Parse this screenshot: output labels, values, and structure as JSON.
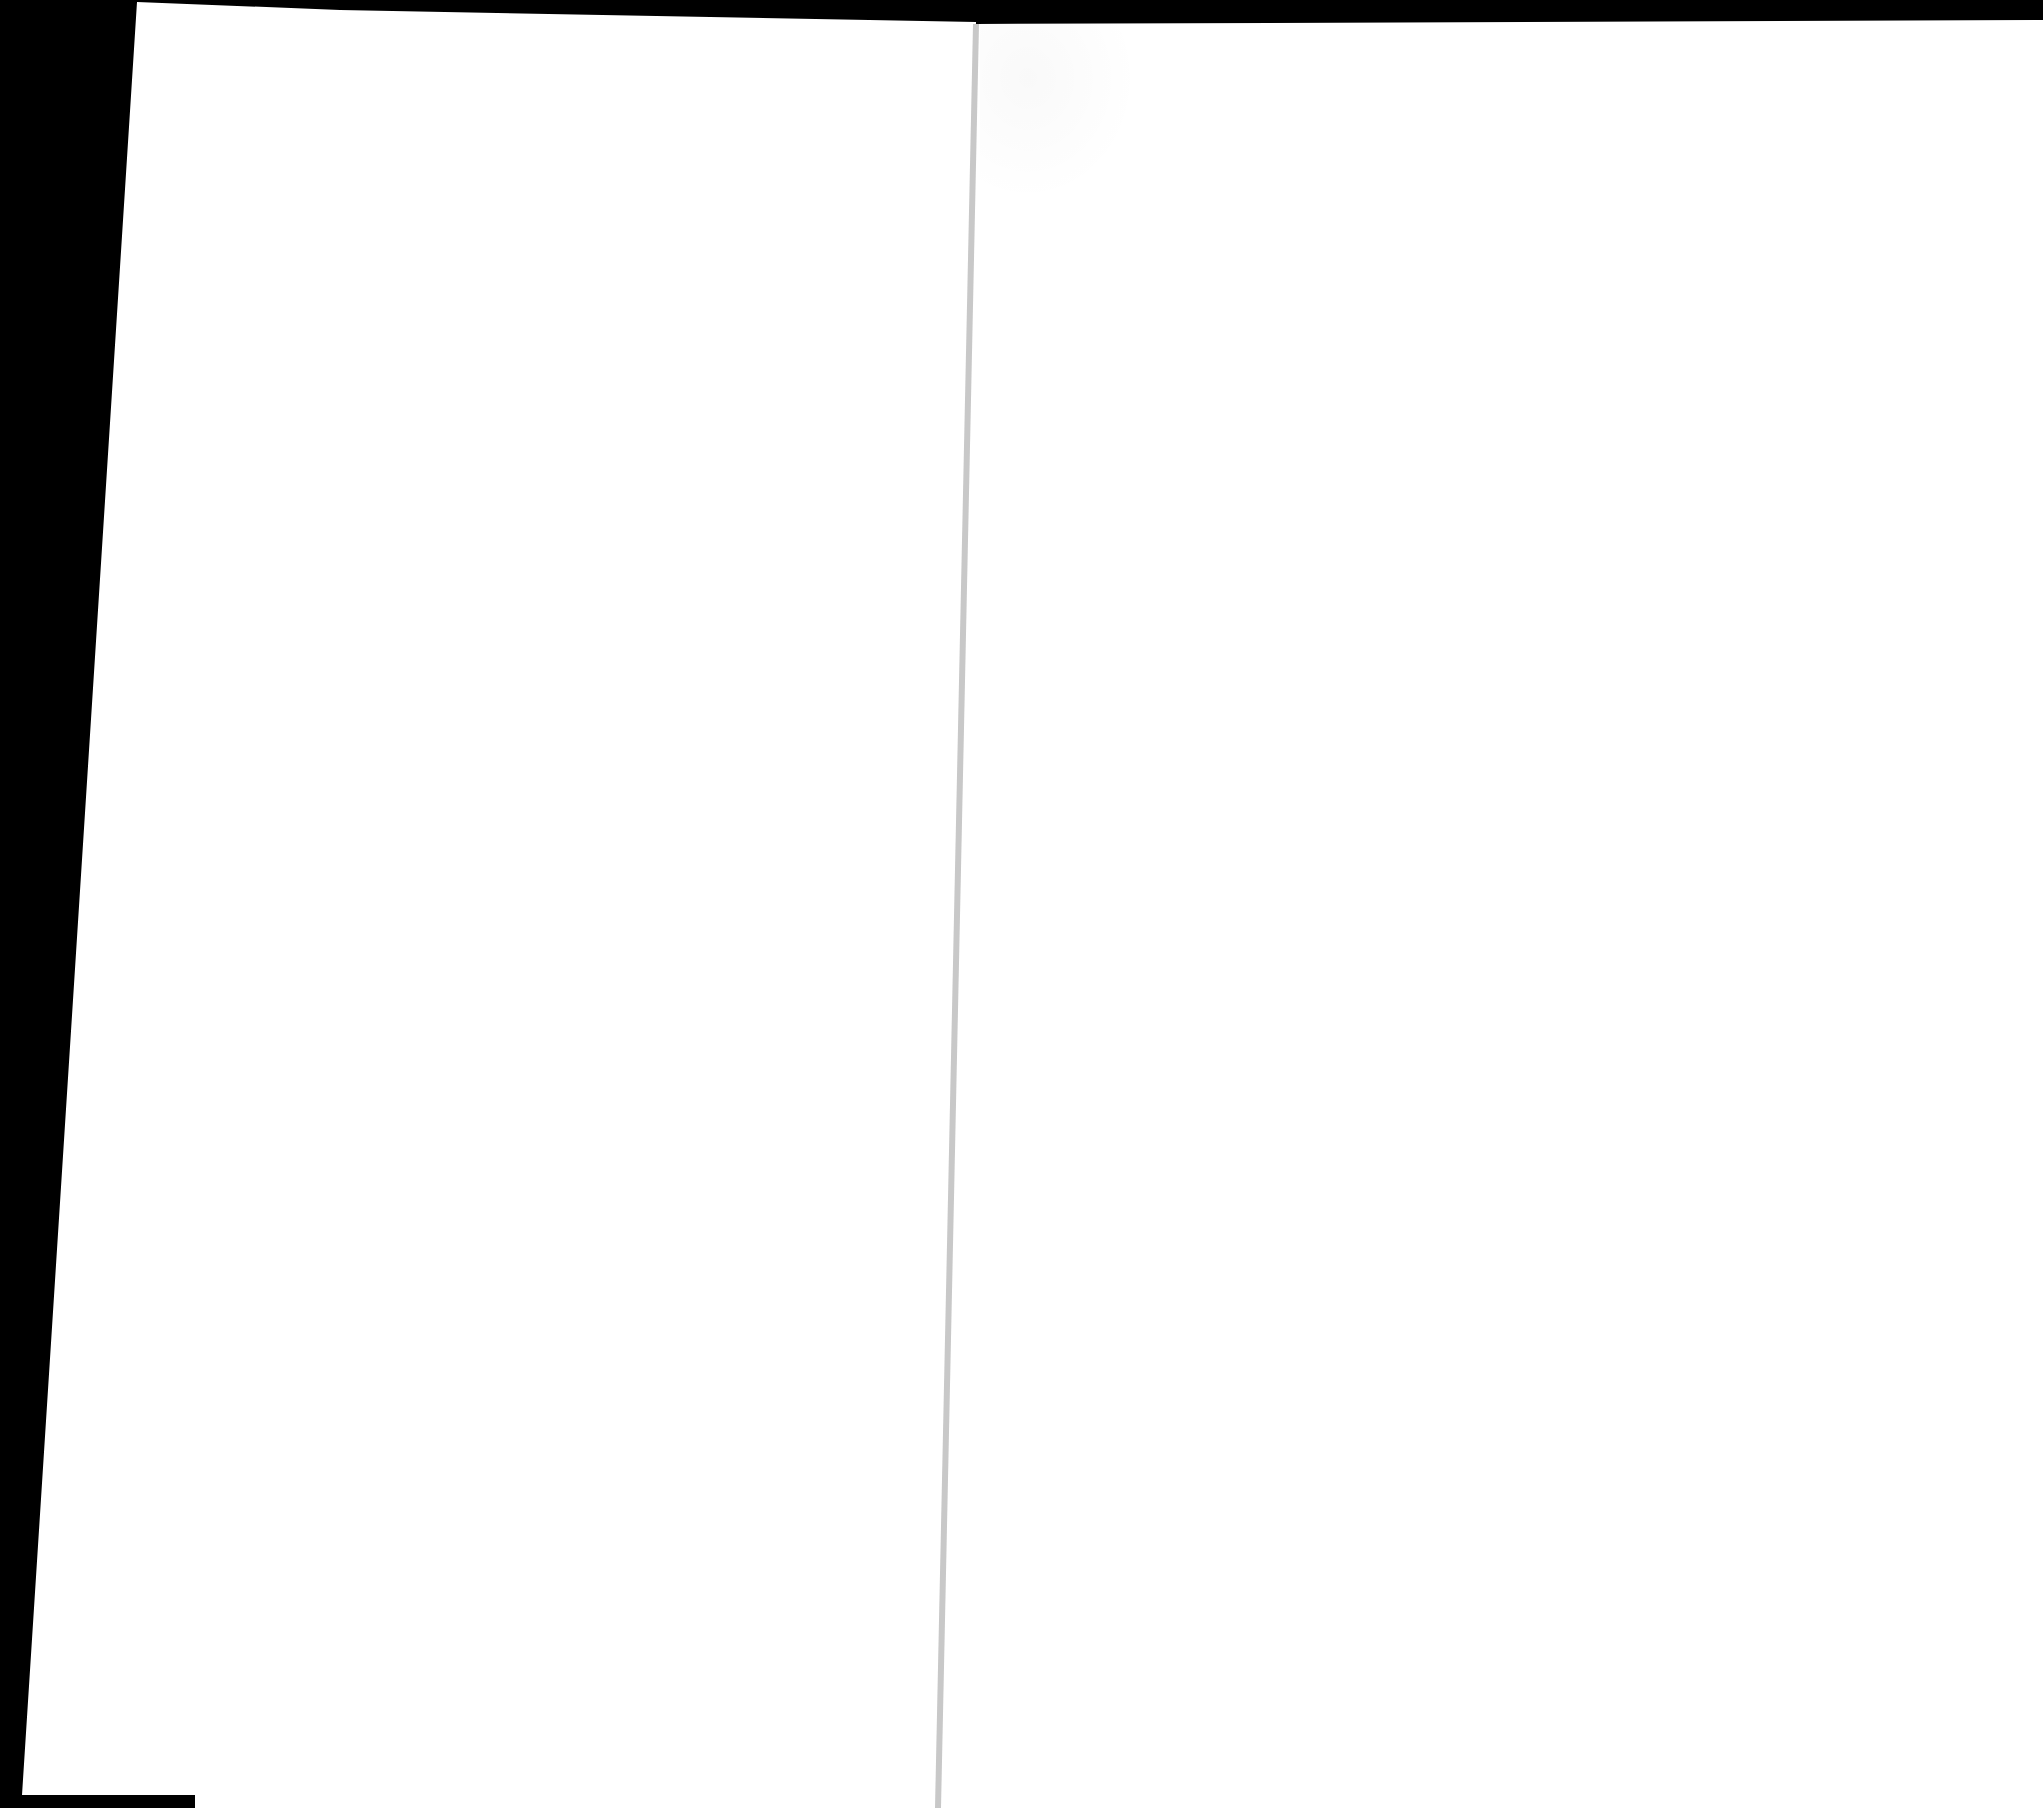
{
  "document": {
    "type": "scanned-book-spread",
    "pages": [
      {
        "side": "left",
        "text": ""
      },
      {
        "side": "right",
        "text": ""
      }
    ]
  },
  "colors": {
    "background": "#000000",
    "page": "#ffffff",
    "gutter": "#c8c8c8"
  }
}
